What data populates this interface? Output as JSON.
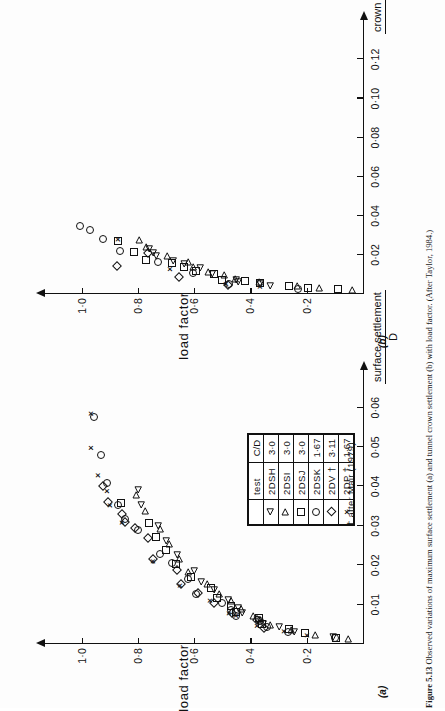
{
  "figure": {
    "caption_label": "Figure 5.13",
    "caption_text": "Observed variations of maximum surface settlement (a) and tunnel crown settlement (b) with load factor. (After Taylor, 1984.)"
  },
  "legend": {
    "headers": [
      "test",
      "C/D"
    ],
    "rows": [
      {
        "symbol": "triangle-left",
        "test": "2DSH",
        "cd": "3·0"
      },
      {
        "symbol": "triangle-right",
        "test": "2DSI",
        "cd": "3·0"
      },
      {
        "symbol": "square",
        "test": "2DSJ",
        "cd": "3·0"
      },
      {
        "symbol": "circle",
        "test": "2DSK",
        "cd": "1·67"
      },
      {
        "symbol": "diamond",
        "test": "2DV †",
        "cd": "3·11"
      },
      {
        "symbol": "cross",
        "test": "2DP †",
        "cd": "1·67"
      }
    ],
    "note": "† after Mair (1979)"
  },
  "chart_data": [
    {
      "id": "a",
      "panel_label": "(a)",
      "type": "scatter",
      "title": "",
      "xlabel_numerator": "surface settlement",
      "xlabel_denominator": "D",
      "ylabel": "load  factor",
      "xticks": [
        0.01,
        0.02,
        0.03,
        0.04,
        0.05,
        0.06
      ],
      "xtick_labels": [
        "0·01",
        "0·02",
        "0·03",
        "0·04",
        "0·05",
        "0·06"
      ],
      "yticks": [
        0.2,
        0.4,
        0.6,
        0.8,
        1.0
      ],
      "ytick_labels": [
        "0·2",
        "0·4",
        "0·6",
        "0·8",
        "1·0"
      ],
      "xlim": [
        0,
        0.066
      ],
      "ylim": [
        0,
        1.08
      ],
      "grid": false,
      "legend_position": "inside-lower-right",
      "series": [
        {
          "name": "2DSH",
          "symbol": "triangle-left",
          "points": [
            [
              0.0018,
              0.105
            ],
            [
              0.003,
              0.245
            ],
            [
              0.0042,
              0.3
            ],
            [
              0.005,
              0.355
            ],
            [
              0.0062,
              0.375
            ],
            [
              0.0078,
              0.43
            ],
            [
              0.0092,
              0.445
            ],
            [
              0.0112,
              0.48
            ],
            [
              0.0138,
              0.53
            ],
            [
              0.0158,
              0.575
            ],
            [
              0.0186,
              0.6
            ],
            [
              0.0225,
              0.66
            ],
            [
              0.0262,
              0.7
            ],
            [
              0.03,
              0.73
            ],
            [
              0.0352,
              0.79
            ],
            [
              0.0392,
              0.8
            ]
          ]
        },
        {
          "name": "2DSI",
          "symbol": "triangle-right",
          "points": [
            [
              0.0012,
              0.055
            ],
            [
              0.0022,
              0.17
            ],
            [
              0.0035,
              0.255
            ],
            [
              0.0048,
              0.33
            ],
            [
              0.006,
              0.365
            ],
            [
              0.0072,
              0.39
            ],
            [
              0.009,
              0.435
            ],
            [
              0.0108,
              0.47
            ],
            [
              0.0128,
              0.51
            ],
            [
              0.0152,
              0.555
            ],
            [
              0.0182,
              0.62
            ],
            [
              0.0215,
              0.655
            ],
            [
              0.0255,
              0.69
            ],
            [
              0.0292,
              0.72
            ],
            [
              0.0338,
              0.775
            ],
            [
              0.0378,
              0.805
            ]
          ]
        },
        {
          "name": "2DSJ",
          "symbol": "square",
          "points": [
            [
              0.0016,
              0.095
            ],
            [
              0.0028,
              0.205
            ],
            [
              0.0038,
              0.262
            ],
            [
              0.0052,
              0.36
            ],
            [
              0.0065,
              0.37
            ],
            [
              0.008,
              0.45
            ],
            [
              0.0096,
              0.47
            ],
            [
              0.0118,
              0.52
            ],
            [
              0.0142,
              0.54
            ],
            [
              0.017,
              0.61
            ],
            [
              0.0202,
              0.665
            ],
            [
              0.0238,
              0.7
            ],
            [
              0.0272,
              0.735
            ],
            [
              0.0308,
              0.76
            ],
            [
              0.0358,
              0.86
            ]
          ]
        },
        {
          "name": "2DSK",
          "symbol": "circle",
          "points": [
            [
              0.0015,
              0.1
            ],
            [
              0.003,
              0.265
            ],
            [
              0.0042,
              0.34
            ],
            [
              0.0058,
              0.365
            ],
            [
              0.007,
              0.45
            ],
            [
              0.0086,
              0.47
            ],
            [
              0.0104,
              0.5
            ],
            [
              0.0126,
              0.595
            ],
            [
              0.0164,
              0.62
            ],
            [
              0.0205,
              0.68
            ],
            [
              0.0228,
              0.72
            ],
            [
              0.029,
              0.8
            ],
            [
              0.0318,
              0.845
            ],
            [
              0.0352,
              0.87
            ],
            [
              0.0408,
              0.91
            ],
            [
              0.048,
              0.93
            ],
            [
              0.0575,
              0.955
            ]
          ]
        },
        {
          "name": "2DV",
          "symbol": "diamond",
          "points": [
            [
              0.004,
              0.35
            ],
            [
              0.006,
              0.375
            ],
            [
              0.0078,
              0.465
            ],
            [
              0.0104,
              0.53
            ],
            [
              0.013,
              0.585
            ],
            [
              0.0152,
              0.645
            ],
            [
              0.0188,
              0.66
            ],
            [
              0.0215,
              0.745
            ],
            [
              0.0268,
              0.765
            ],
            [
              0.0295,
              0.81
            ],
            [
              0.031,
              0.845
            ],
            [
              0.033,
              0.855
            ],
            [
              0.036,
              0.905
            ],
            [
              0.04,
              0.925
            ]
          ]
        },
        {
          "name": "2DP",
          "symbol": "cross",
          "points": [
            [
              0.0022,
              0.2
            ],
            [
              0.0032,
              0.28
            ],
            [
              0.0046,
              0.375
            ],
            [
              0.0072,
              0.45
            ],
            [
              0.0078,
              0.475
            ],
            [
              0.011,
              0.545
            ],
            [
              0.0148,
              0.65
            ],
            [
              0.021,
              0.745
            ],
            [
              0.0308,
              0.855
            ],
            [
              0.0352,
              0.9
            ],
            [
              0.0388,
              0.91
            ],
            [
              0.0428,
              0.94
            ],
            [
              0.0498,
              0.965
            ],
            [
              0.0585,
              0.968
            ]
          ]
        }
      ]
    },
    {
      "id": "b",
      "panel_label": "(b)",
      "type": "scatter",
      "title": "",
      "xlabel_numerator": "crown settlement",
      "xlabel_denominator": "D",
      "ylabel": "load  factor",
      "xticks": [
        0.02,
        0.04,
        0.06,
        0.08,
        0.1,
        0.12
      ],
      "xtick_labels": [
        "0·02",
        "0·04",
        "0·06",
        "0·08",
        "0·10",
        "0·12"
      ],
      "yticks": [
        0.2,
        0.4,
        0.6,
        0.8,
        1.0
      ],
      "ytick_labels": [
        "0·2",
        "0·4",
        "0·6",
        "0·8",
        "1·0"
      ],
      "xlim": [
        0,
        0.133
      ],
      "ylim": [
        0,
        1.08
      ],
      "grid": false,
      "legend_position": "none",
      "series": [
        {
          "name": "2DSH",
          "symbol": "triangle-left",
          "points": [
            [
              0.004,
              0.33
            ],
            [
              0.0052,
              0.365
            ],
            [
              0.006,
              0.445
            ],
            [
              0.0072,
              0.45
            ],
            [
              0.0102,
              0.535
            ],
            [
              0.0132,
              0.58
            ],
            [
              0.0152,
              0.635
            ],
            [
              0.0168,
              0.675
            ],
            [
              0.0192,
              0.735
            ],
            [
              0.021,
              0.745
            ],
            [
              0.0232,
              0.76
            ]
          ]
        },
        {
          "name": "2DSI",
          "symbol": "triangle-right",
          "points": [
            [
              0.0022,
              0.04
            ],
            [
              0.003,
              0.155
            ],
            [
              0.0042,
              0.235
            ],
            [
              0.0062,
              0.37
            ],
            [
              0.0078,
              0.455
            ],
            [
              0.0095,
              0.495
            ],
            [
              0.0112,
              0.55
            ],
            [
              0.014,
              0.605
            ],
            [
              0.0162,
              0.62
            ],
            [
              0.0196,
              0.695
            ],
            [
              0.0238,
              0.77
            ],
            [
              0.0278,
              0.795
            ]
          ]
        },
        {
          "name": "2DSJ",
          "symbol": "square",
          "points": [
            [
              0.0024,
              0.09
            ],
            [
              0.0032,
              0.195
            ],
            [
              0.004,
              0.262
            ],
            [
              0.0058,
              0.365
            ],
            [
              0.0065,
              0.42
            ],
            [
              0.0072,
              0.5
            ],
            [
              0.01,
              0.53
            ],
            [
              0.0118,
              0.595
            ],
            [
              0.014,
              0.635
            ],
            [
              0.0158,
              0.68
            ],
            [
              0.0175,
              0.77
            ],
            [
              0.0215,
              0.815
            ],
            [
              0.0272,
              0.87
            ]
          ]
        },
        {
          "name": "2DSK",
          "symbol": "circle",
          "points": [
            [
              0.0028,
              0.23
            ],
            [
              0.0052,
              0.475
            ],
            [
              0.0105,
              0.605
            ],
            [
              0.0165,
              0.73
            ],
            [
              0.0218,
              0.865
            ],
            [
              0.0282,
              0.925
            ],
            [
              0.0325,
              0.97
            ],
            [
              0.0348,
              1.005
            ]
          ]
        },
        {
          "name": "2DV",
          "symbol": "diamond",
          "points": [
            [
              0.0048,
              0.48
            ],
            [
              0.0085,
              0.655
            ],
            [
              0.0145,
              0.875
            ],
            [
              0.0208,
              0.765
            ]
          ]
        },
        {
          "name": "2DP",
          "symbol": "cross",
          "points": [
            [
              0.0038,
              0.365
            ],
            [
              0.0052,
              0.485
            ],
            [
              0.0128,
              0.685
            ],
            [
              0.028,
              0.87
            ]
          ]
        }
      ]
    }
  ]
}
